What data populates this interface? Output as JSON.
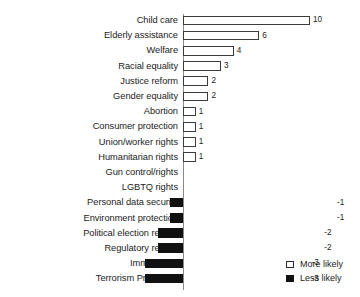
{
  "chart_data": {
    "type": "bar",
    "orientation": "horizontal",
    "title": "",
    "subtitle": "",
    "xlabel": "",
    "ylabel": "",
    "grid": false,
    "xlim": [
      -3,
      10
    ],
    "axis_zero": 0,
    "legend_position": "bottom-right",
    "categories": [
      "Child care",
      "Elderly assistance",
      "Welfare",
      "Racial equality",
      "Justice reform",
      "Gender equality",
      "Abortion",
      "Consumer protection",
      "Union/worker rights",
      "Humanitarian rights",
      "Gun control/rights",
      "LGBTQ rights",
      "Personal data security",
      "Environment protection",
      "Political election reform",
      "Regulatory reform",
      "Immigration",
      "Terrorism Protection"
    ],
    "values": [
      10,
      6,
      4,
      3,
      2,
      2,
      1,
      1,
      1,
      1,
      0,
      0,
      -1,
      -1,
      -2,
      -2,
      -3,
      -3
    ],
    "value_labels": [
      "10",
      "6",
      "4",
      "3",
      "2",
      "2",
      "1",
      "1",
      "1",
      "1",
      "",
      "",
      "-1",
      "-1",
      "-2",
      "-2",
      "-3",
      "-3"
    ],
    "series": [
      {
        "name": "More likely",
        "color": "#ffffff",
        "border_color": "#3b3b3b",
        "applies_to": "positive"
      },
      {
        "name": "Less likely",
        "color": "#111111",
        "border_color": "#111111",
        "applies_to": "negative"
      }
    ],
    "legend": [
      {
        "label": "More likely",
        "swatch": "outlined-square-icon"
      },
      {
        "label": "Less likely",
        "swatch": "filled-square-icon"
      }
    ]
  }
}
